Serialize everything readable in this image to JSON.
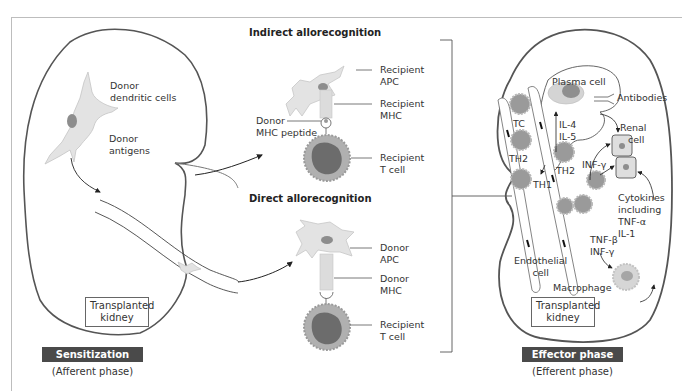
{
  "left_kidney": {
    "labels": {
      "donor_dendritic_cells": "Donor\ndendritic cells",
      "donor_dendritic_line1": "Donor",
      "donor_dendritic_line2": "dendritic cells",
      "donor_antigens_line1": "Donor",
      "donor_antigens_line2": "antigens"
    },
    "box_label_line1": "Transplanted",
    "box_label_line2": "kidney",
    "phase_label": "Sensitization phase",
    "phase_sub": "(Afferent phase)"
  },
  "indirect": {
    "title": "Indirect allorecognition",
    "panel_header": "Lymph node",
    "labels": {
      "apc_1": "Recipient",
      "apc_2": "APC",
      "mhc_1": "Recipient",
      "mhc_2": "MHC",
      "tcell_1": "Recipient",
      "tcell_2": "T cell",
      "peptide_1": "Donor",
      "peptide_2": "MHC peptide"
    }
  },
  "direct": {
    "title": "Direct allorecognition",
    "panel_header": "Spleen",
    "labels": {
      "apc_1": "Donor",
      "apc_2": "APC",
      "mhc_1": "Donor",
      "mhc_2": "MHC",
      "tcell_1": "Recipient",
      "tcell_2": "T cell"
    }
  },
  "right_kidney": {
    "labels": {
      "plasma_cell": "Plasma cell",
      "antibodies": "Antibodies",
      "tc": "TC",
      "th2_left": "TH2",
      "th2_right": "TH2",
      "th1": "TH1",
      "il4": "IL-4",
      "il5": "IL-5",
      "renal_1": "Renal",
      "renal_2": "cell",
      "inf_gamma": "INF-γ",
      "cytokines_1": "Cytokines",
      "cytokines_2": "including",
      "cytokines_3": "TNF-α",
      "cytokines_4": "IL-1",
      "tnf_beta": "TNF-β",
      "inf_gamma_2": "INF-γ",
      "endothelial_1": "Endothelial",
      "endothelial_2": "cell",
      "macrophage": "Macrophage"
    },
    "box_label_line1": "Transplanted",
    "box_label_line2": "kidney",
    "phase_label": "Effector phase",
    "phase_sub": "(Efferent phase)"
  },
  "colors": {
    "phase_bar": "#4a4a4a",
    "panel_bg": "#f7f7f7",
    "panel_header_bg": "#e2e2e2",
    "cell_fill": "#dcdcdc",
    "nucleus": "#8a8a8a",
    "tcell_body": "#6e6e6e",
    "outline": "#555555"
  }
}
